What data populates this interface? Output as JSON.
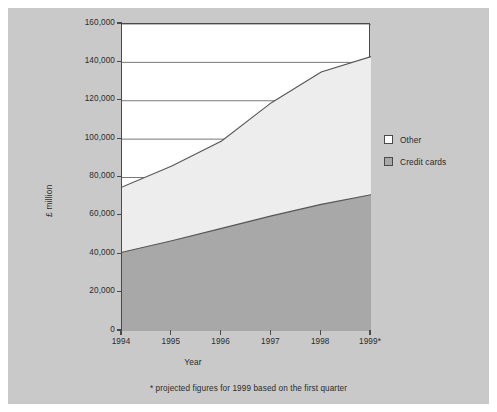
{
  "figure": {
    "background_color": "#c9c9c9",
    "plot_background_color": "#ffffff",
    "axis_color": "#4a4a4a"
  },
  "legend": {
    "position": "right",
    "entries": [
      {
        "label": "Other",
        "color": "#ededed",
        "swatch_name": "legend-swatch-other"
      },
      {
        "label": "Credit cards",
        "color": "#a8a8a8",
        "swatch_name": "legend-swatch-credit-cards"
      }
    ]
  },
  "footnote": "* projected figures for 1999 based on the first quarter",
  "chart_data": {
    "type": "area",
    "stacked": true,
    "title": "",
    "xlabel": "Year",
    "ylabel": "£ million",
    "categories": [
      "1994",
      "1995",
      "1996",
      "1997",
      "1998",
      "1999*"
    ],
    "x_tick_labels": [
      "1994",
      "1995",
      "1996",
      "1997",
      "1998",
      "1999*"
    ],
    "y_tick_labels": [
      "0",
      "20,000",
      "40,000",
      "60,000",
      "80,000",
      "100,000",
      "120,000",
      "140,000",
      "160,000"
    ],
    "y_tick_values": [
      0,
      20000,
      40000,
      60000,
      80000,
      100000,
      120000,
      140000,
      160000
    ],
    "ylim": [
      0,
      160000
    ],
    "grid": "horizontal",
    "series": [
      {
        "name": "Credit cards",
        "color": "#a8a8a8",
        "values": [
          41000,
          47000,
          53500,
          60000,
          66000,
          71000
        ]
      },
      {
        "name": "Other",
        "color": "#ededed",
        "values": [
          34000,
          39000,
          45500,
          59000,
          69000,
          72000
        ]
      }
    ],
    "totals": [
      75000,
      86000,
      99000,
      119000,
      135000,
      143000
    ],
    "annotations": [
      "* projected figures for 1999 based on the first quarter"
    ]
  }
}
